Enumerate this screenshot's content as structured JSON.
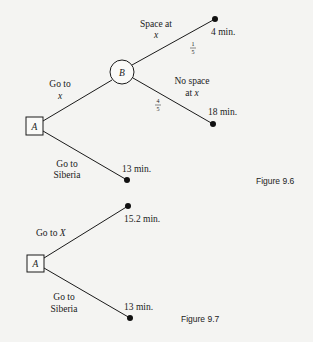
{
  "figure_9_6": {
    "caption": "Figure 9.6",
    "decision_node": "A",
    "chance_node": "B",
    "branch_go_to_x_line1": "Go to",
    "branch_go_to_x_line2": "x",
    "branch_space_line1": "Space at",
    "branch_space_line2": "x",
    "prob_space_num": "1",
    "prob_space_den": "5",
    "outcome_space": "4 min.",
    "branch_nospace_line1": "No space",
    "branch_nospace_line2a": "at ",
    "branch_nospace_line2b": "x",
    "prob_nospace_num": "4",
    "prob_nospace_den": "5",
    "outcome_nospace": "18 min.",
    "branch_siberia_line1": "Go to",
    "branch_siberia_line2": "Siberia",
    "outcome_siberia": "13 min."
  },
  "figure_9_7": {
    "caption": "Figure 9.7",
    "decision_node": "A",
    "branch_go_to_x_a": "Go to ",
    "branch_go_to_x_b": "X",
    "outcome_go_to_x": "15.2 min.",
    "branch_siberia_line1": "Go to",
    "branch_siberia_line2": "Siberia",
    "outcome_siberia": "13 min."
  }
}
